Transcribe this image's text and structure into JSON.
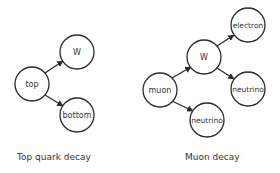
{
  "colors": {
    "stroke": "#2b2b2b",
    "text": "#333333",
    "background": "#ffffff"
  },
  "diagrams": [
    {
      "caption": "Top quark decay",
      "nodes": [
        {
          "id": "top",
          "label": "top"
        },
        {
          "id": "w",
          "label": "W"
        },
        {
          "id": "bottom",
          "label": "bottom"
        }
      ],
      "edges": [
        {
          "from": "top",
          "to": "w"
        },
        {
          "from": "top",
          "to": "bottom"
        }
      ]
    },
    {
      "caption": "Muon decay",
      "nodes": [
        {
          "id": "muon",
          "label": "muon"
        },
        {
          "id": "w",
          "label": "W"
        },
        {
          "id": "electron",
          "label": "electron"
        },
        {
          "id": "neutrino_right",
          "label": "neutrino"
        },
        {
          "id": "neutrino_bottom",
          "label": "neutrino"
        }
      ],
      "edges": [
        {
          "from": "muon",
          "to": "w"
        },
        {
          "from": "muon",
          "to": "neutrino_bottom"
        },
        {
          "from": "w",
          "to": "electron"
        },
        {
          "from": "w",
          "to": "neutrino_right"
        }
      ]
    }
  ]
}
